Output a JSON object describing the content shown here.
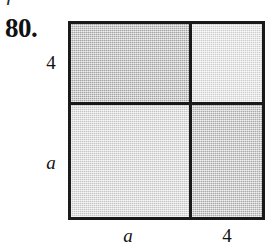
{
  "figure": {
    "exercise_number": "80.",
    "clipped_text_above": "r",
    "border_color": "#1a1a1a",
    "quadrants": [
      {
        "position": "top-left",
        "name": "quadrant-top-left",
        "shade_label": "medium gray",
        "color": "#b5b5b5",
        "width_term": "a",
        "height_term": "4"
      },
      {
        "position": "top-right",
        "name": "quadrant-top-right",
        "shade_label": "lightest gray",
        "color": "#e6e6e6",
        "width_term": "4",
        "height_term": "4"
      },
      {
        "position": "bottom-left",
        "name": "quadrant-bottom-left",
        "shade_label": "light gray",
        "color": "#dcdcdc",
        "width_term": "a",
        "height_term": "a"
      },
      {
        "position": "bottom-right",
        "name": "quadrant-bottom-right",
        "shade_label": "medium gray",
        "color": "#bdbdbd",
        "width_term": "4",
        "height_term": "a"
      }
    ],
    "labels": {
      "left_top": "4",
      "left_bottom": "a",
      "bottom_left": "a",
      "bottom_right": "4"
    }
  }
}
